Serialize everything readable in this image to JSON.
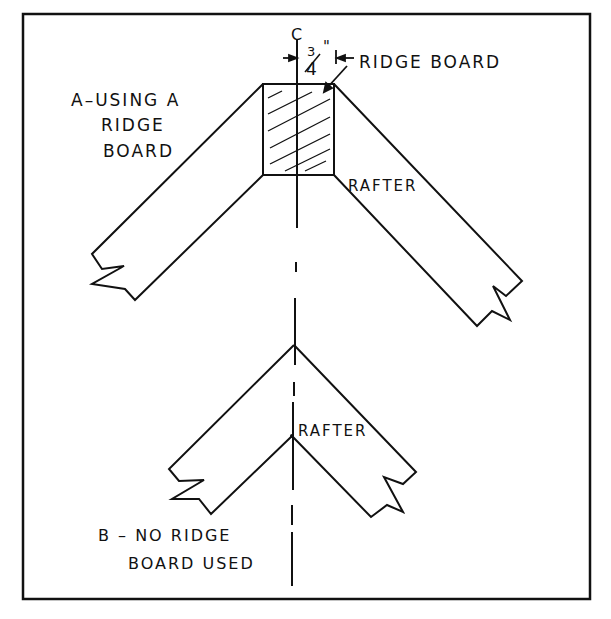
{
  "figure": {
    "frame": {
      "x": 23,
      "y": 14,
      "width": 567,
      "height": 585
    },
    "ink_color": "#111111",
    "background": "#ffffff"
  },
  "labels": {
    "centerline_mark": "C",
    "dimension": {
      "numerator": "3",
      "denominator": "4",
      "unit": "\""
    },
    "ridge_board": "RIDGE BOARD",
    "detail_a_line1": "A–USING A",
    "detail_a_line2": "RIDGE",
    "detail_a_line3": "BOARD",
    "rafter_a": "RAFTER",
    "rafter_b": "RAFTER",
    "detail_b_line1": "B – NO RIDGE",
    "detail_b_line2": "BOARD USED"
  }
}
